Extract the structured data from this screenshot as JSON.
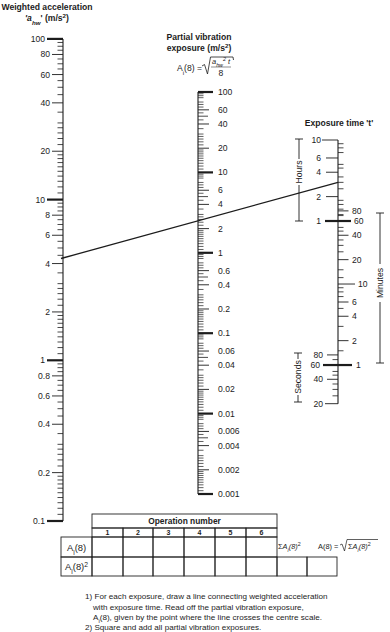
{
  "titles": {
    "left_line1": "Weighted acceleration",
    "left_line2": [
      [
        "'a",
        "it"
      ],
      [
        "hw",
        "sub-it"
      ],
      [
        "' (m/s",
        ""
      ],
      [
        "2",
        "sup"
      ],
      [
        ")",
        ""
      ]
    ],
    "center_line1": "Partial vibration",
    "center_line2": [
      [
        "exposure (m/s",
        ""
      ],
      [
        "2",
        "sup"
      ],
      [
        ")",
        ""
      ]
    ],
    "formula": {
      "lhs": [
        [
          "A",
          ""
        ],
        [
          "i",
          "sub"
        ],
        [
          "(8) =",
          ""
        ]
      ],
      "numerator": [
        [
          "a",
          "it"
        ],
        [
          "hw",
          "sub-it"
        ],
        [
          "2",
          "sup-it"
        ],
        [
          " t",
          "it"
        ]
      ],
      "denominator": "8"
    },
    "right_title": "Exposure time 't'"
  },
  "brackets": {
    "hours": "Hours",
    "minutes": "Minutes",
    "seconds": "Seconds"
  },
  "chart_data": {
    "type": "line",
    "subtype": "nomogram",
    "title": "",
    "formula": "A_i(8) = sqrt(a_hw^2 * t / 8)",
    "scales": [
      {
        "id": "left",
        "label": "Weighted acceleration 'a_hw' (m/s²)",
        "scale": "log",
        "range": [
          0.1,
          100
        ],
        "tick_labels": [
          "100",
          "80",
          "60",
          "40",
          "20",
          "10",
          "8",
          "6",
          "4",
          "2",
          "1",
          "0.8",
          "0.6",
          "0.4",
          "0.2",
          "0.1"
        ]
      },
      {
        "id": "center",
        "label": "Partial vibration exposure A_i(8) (m/s²)",
        "scale": "log",
        "range": [
          0.001,
          100
        ],
        "tick_labels": [
          "100",
          "60",
          "40",
          "20",
          "10",
          "6",
          "4",
          "2",
          "1",
          "0.6",
          "0.4",
          "0.2",
          "0.1",
          "0.06",
          "0.04",
          "0.02",
          "0.01",
          "0.006",
          "0.004",
          "0.002",
          "0.001"
        ]
      },
      {
        "id": "right",
        "label": "Exposure time 't'",
        "scale": "log",
        "segments": [
          {
            "unit": "Hours",
            "side": "left",
            "range": [
              1,
              10
            ],
            "tick_labels": [
              "10",
              "6",
              "4",
              "2",
              "1"
            ]
          },
          {
            "unit": "Minutes",
            "side": "right",
            "range": [
              1,
              80
            ],
            "tick_labels": [
              "80",
              "60",
              "40",
              "20",
              "10",
              "6",
              "4",
              "2",
              "1"
            ]
          },
          {
            "unit": "Seconds",
            "side": "left",
            "range": [
              20,
              80
            ],
            "tick_labels": [
              "80",
              "60",
              "40",
              "20"
            ]
          }
        ]
      }
    ],
    "example_line": {
      "a_hw": 4.3,
      "t_hours": 3,
      "A_i_8": 2.6
    }
  },
  "table": {
    "header": "Operation number",
    "columns": [
      "1",
      "2",
      "3",
      "4",
      "5",
      "6"
    ],
    "rows": [
      {
        "label": [
          [
            "A",
            ""
          ],
          [
            "i",
            "sub"
          ],
          [
            "(8)",
            ""
          ]
        ],
        "cells": [
          "",
          "",
          "",
          "",
          "",
          ""
        ]
      },
      {
        "label": [
          [
            "A",
            ""
          ],
          [
            "i",
            "sub"
          ],
          [
            "(8)",
            ""
          ],
          [
            "2",
            "sup"
          ]
        ],
        "cells": [
          "",
          "",
          "",
          "",
          "",
          "",
          "",
          ""
        ]
      }
    ],
    "sum_label": [
      [
        "Σ",
        ""
      ],
      [
        "A",
        "it"
      ],
      [
        "i",
        "sub-it"
      ],
      [
        "(8)",
        "it"
      ],
      [
        "2",
        "sup"
      ]
    ],
    "total_lhs": "A(8) =",
    "total_radicand": [
      [
        "Σ",
        ""
      ],
      [
        "A",
        "it"
      ],
      [
        "i",
        "sub-it"
      ],
      [
        "(8)",
        "it"
      ],
      [
        "2",
        "sup"
      ]
    ]
  },
  "instructions": [
    {
      "indent": false,
      "parts": [
        [
          "1) For each exposure, draw a line connecting weighted acceleration",
          ""
        ]
      ]
    },
    {
      "indent": true,
      "parts": [
        [
          "with exposure time. Read off the partial vibration exposure,",
          ""
        ]
      ]
    },
    {
      "indent": true,
      "parts": [
        [
          "A",
          ""
        ],
        [
          "i",
          "sub"
        ],
        [
          "(8), given by the point where the line crosses the centre scale.",
          ""
        ]
      ]
    },
    {
      "indent": false,
      "parts": [
        [
          "2) Square and add all partial vibration exposures.",
          ""
        ]
      ]
    }
  ]
}
